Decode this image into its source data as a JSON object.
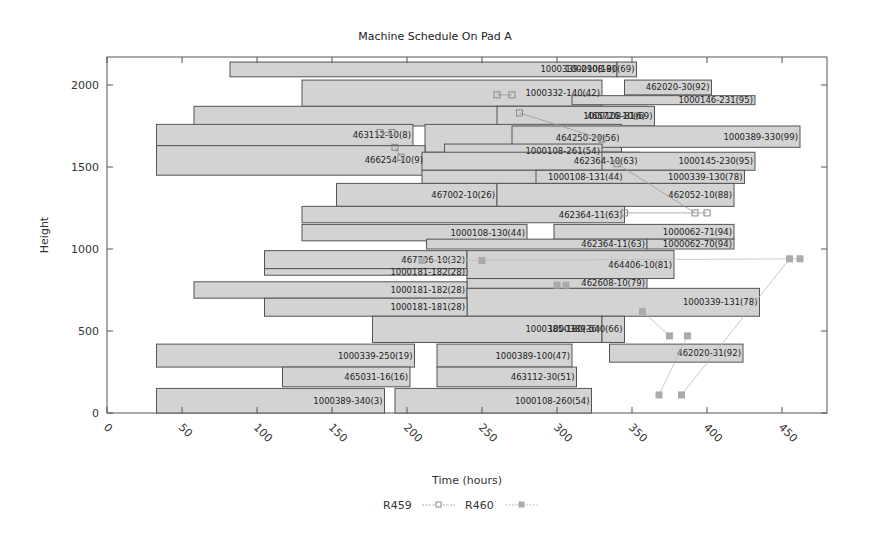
{
  "chart_data": {
    "type": "gantt-bar",
    "title": "Machine Schedule On Pad A",
    "xlabel": "Time (hours)",
    "ylabel": "Height",
    "xlim": [
      0,
      475
    ],
    "ylim": [
      0,
      2170
    ],
    "xticks": [
      0,
      50,
      100,
      150,
      200,
      250,
      300,
      350,
      400,
      450
    ],
    "yticks": [
      0,
      500,
      1000,
      1500,
      2000
    ],
    "grid": false,
    "legend_position": "bottom",
    "legend": [
      {
        "name": "R459",
        "marker": "open-square",
        "color": "#999999"
      },
      {
        "name": "R460",
        "marker": "filled-square",
        "color": "#aaaaaa"
      }
    ],
    "bars": [
      {
        "label": "1000339-290(19)",
        "x0": 82,
        "x1": 340,
        "y0": 2050,
        "y1": 2140
      },
      {
        "label": "1000108-80(69)",
        "x0": 340,
        "x1": 353,
        "y0": 2050,
        "y1": 2140
      },
      {
        "label": "1000332-140(42)",
        "x0": 130,
        "x1": 330,
        "y0": 1870,
        "y1": 2030
      },
      {
        "label": "462020-30(92)",
        "x0": 345,
        "x1": 403,
        "y0": 1940,
        "y1": 2030
      },
      {
        "label": "1000146-231(95)",
        "x0": 310,
        "x1": 432,
        "y0": 1880,
        "y1": 1935
      },
      {
        "label": "465726-10(6)",
        "x0": 58,
        "x1": 360,
        "y0": 1750,
        "y1": 1870
      },
      {
        "label": "1000108-81(69)",
        "x0": 260,
        "x1": 365,
        "y0": 1750,
        "y1": 1870
      },
      {
        "label": "463112-10(8)",
        "x0": 33,
        "x1": 204,
        "y0": 1630,
        "y1": 1760
      },
      {
        "label": "464250-20(56)",
        "x0": 212,
        "x1": 343,
        "y0": 1590,
        "y1": 1760
      },
      {
        "label": "1000389-330(99)",
        "x0": 270,
        "x1": 462,
        "y0": 1620,
        "y1": 1750
      },
      {
        "label": "1000108-261(54)",
        "x0": 225,
        "x1": 330,
        "y0": 1560,
        "y1": 1640
      },
      {
        "label": "466254-10(9)",
        "x0": 33,
        "x1": 212,
        "y0": 1450,
        "y1": 1630
      },
      {
        "label": "462364-10(63)",
        "x0": 210,
        "x1": 355,
        "y0": 1480,
        "y1": 1590
      },
      {
        "label": "1000145-230(95)",
        "x0": 330,
        "x1": 432,
        "y0": 1480,
        "y1": 1590
      },
      {
        "label": "1000108-131(44)",
        "x0": 210,
        "x1": 345,
        "y0": 1400,
        "y1": 1480
      },
      {
        "label": "1000339-130(78)",
        "x0": 286,
        "x1": 425,
        "y0": 1400,
        "y1": 1480
      },
      {
        "label": "467002-10(26)",
        "x0": 153,
        "x1": 260,
        "y0": 1260,
        "y1": 1400
      },
      {
        "label": "462052-10(88)",
        "x0": 260,
        "x1": 418,
        "y0": 1260,
        "y1": 1400
      },
      {
        "label": "462364-11(63)",
        "x0": 130,
        "x1": 345,
        "y0": 1160,
        "y1": 1260
      },
      {
        "label": "1000108-130(44)",
        "x0": 130,
        "x1": 280,
        "y0": 1050,
        "y1": 1150
      },
      {
        "label": "1000062-71(94)",
        "x0": 298,
        "x1": 418,
        "y0": 1060,
        "y1": 1150
      },
      {
        "label": "462364-11(63)",
        "x0": 213,
        "x1": 360,
        "y0": 1000,
        "y1": 1060
      },
      {
        "label": "1000062-70(94)",
        "x0": 360,
        "x1": 418,
        "y0": 1000,
        "y1": 1060
      },
      {
        "label": "467706-10(32)",
        "x0": 105,
        "x1": 240,
        "y0": 880,
        "y1": 990
      },
      {
        "label": "464406-10(81)",
        "x0": 240,
        "x1": 378,
        "y0": 820,
        "y1": 990
      },
      {
        "label": "1000181-182(28)",
        "x0": 105,
        "x1": 240,
        "y0": 840,
        "y1": 880
      },
      {
        "label": "462608-10(79)",
        "x0": 240,
        "x1": 360,
        "y0": 760,
        "y1": 820
      },
      {
        "label": "1000181-182(28)",
        "x0": 58,
        "x1": 240,
        "y0": 700,
        "y1": 800
      },
      {
        "label": "1000339-131(78)",
        "x0": 240,
        "x1": 435,
        "y0": 590,
        "y1": 760
      },
      {
        "label": "1000181-181(28)",
        "x0": 105,
        "x1": 240,
        "y0": 590,
        "y1": 700
      },
      {
        "label": "1000385-180(36)",
        "x0": 177,
        "x1": 330,
        "y0": 430,
        "y1": 590
      },
      {
        "label": "1000389-540(66)",
        "x0": 330,
        "x1": 345,
        "y0": 430,
        "y1": 590
      },
      {
        "label": "1000339-250(19)",
        "x0": 33,
        "x1": 205,
        "y0": 280,
        "y1": 420
      },
      {
        "label": "1000389-100(47)",
        "x0": 220,
        "x1": 310,
        "y0": 280,
        "y1": 420
      },
      {
        "label": "462020-31(92)",
        "x0": 335,
        "x1": 424,
        "y0": 310,
        "y1": 420
      },
      {
        "label": "465031-16(16)",
        "x0": 117,
        "x1": 202,
        "y0": 160,
        "y1": 280
      },
      {
        "label": "463112-30(51)",
        "x0": 220,
        "x1": 313,
        "y0": 160,
        "y1": 280
      },
      {
        "label": "1000389-340(3)",
        "x0": 33,
        "x1": 185,
        "y0": 0,
        "y1": 150
      },
      {
        "label": "1000108-260(54)",
        "x0": 192,
        "x1": 323,
        "y0": 0,
        "y1": 150
      }
    ],
    "markers": {
      "R459": [
        {
          "x": 182,
          "y": 1710
        },
        {
          "x": 190,
          "y": 1710
        },
        {
          "x": 192,
          "y": 1620
        },
        {
          "x": 196,
          "y": 1560
        },
        {
          "x": 260,
          "y": 1940
        },
        {
          "x": 270,
          "y": 1940
        },
        {
          "x": 275,
          "y": 1830
        },
        {
          "x": 330,
          "y": 1670
        },
        {
          "x": 340,
          "y": 1520
        },
        {
          "x": 392,
          "y": 1220
        },
        {
          "x": 400,
          "y": 1220
        },
        {
          "x": 345,
          "y": 1220
        }
      ],
      "R460": [
        {
          "x": 300,
          "y": 780
        },
        {
          "x": 306,
          "y": 780
        },
        {
          "x": 357,
          "y": 620
        },
        {
          "x": 375,
          "y": 470
        },
        {
          "x": 387,
          "y": 470
        },
        {
          "x": 368,
          "y": 110
        },
        {
          "x": 383,
          "y": 110
        },
        {
          "x": 455,
          "y": 940
        },
        {
          "x": 462,
          "y": 940
        },
        {
          "x": 210,
          "y": 930
        },
        {
          "x": 250,
          "y": 930
        }
      ]
    }
  }
}
